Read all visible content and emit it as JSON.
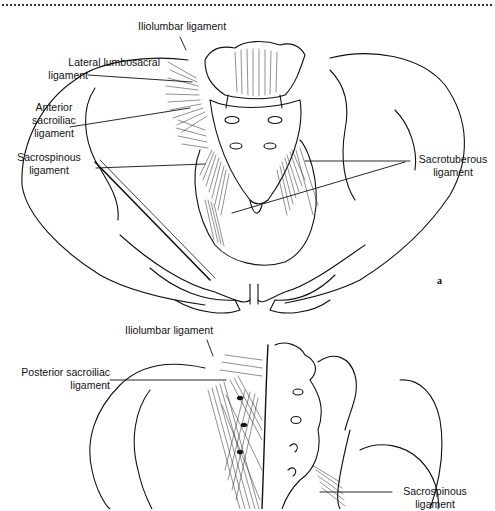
{
  "figure": {
    "type": "anatomical-illustration",
    "header_rule": "dotted",
    "panels": [
      {
        "id": "a",
        "view": "anterior",
        "letter": "a",
        "labels": [
          {
            "key": "iliolumbar",
            "lines": [
              "Iliolumbar ligament"
            ]
          },
          {
            "key": "lateral_lumbosacral",
            "lines": [
              "Lateral lumbosacral",
              "ligament"
            ]
          },
          {
            "key": "anterior_sacroiliac",
            "lines": [
              "Anterior",
              "sacroiliac",
              "ligament"
            ]
          },
          {
            "key": "sacrospinous",
            "lines": [
              "Sacrospinous",
              "ligament"
            ]
          },
          {
            "key": "sacrotuberous",
            "lines": [
              "Sacrotuberous",
              "ligament"
            ]
          }
        ]
      },
      {
        "id": "b",
        "view": "posterior",
        "labels": [
          {
            "key": "iliolumbar",
            "lines": [
              "Iliolumbar ligament"
            ]
          },
          {
            "key": "posterior_sacroiliac",
            "lines": [
              "Posterior sacroiliac",
              "ligament"
            ]
          },
          {
            "key": "sacrospinous",
            "lines": [
              "Sacrospinous",
              "ligament"
            ]
          }
        ]
      }
    ]
  },
  "a": {
    "letter": "a",
    "iliolumbar": "Iliolumbar ligament",
    "lateral_lumbosacral_1": "Lateral lumbosacral",
    "lateral_lumbosacral_2": "ligament",
    "anterior_sacroiliac_1": "Anterior",
    "anterior_sacroiliac_2": "sacroiliac",
    "anterior_sacroiliac_3": "ligament",
    "sacrospinous_1": "Sacrospinous",
    "sacrospinous_2": "ligament",
    "sacrotuberous_1": "Sacrotuberous",
    "sacrotuberous_2": "ligament"
  },
  "b": {
    "iliolumbar": "Iliolumbar ligament",
    "posterior_sacroiliac_1": "Posterior sacroiliac",
    "posterior_sacroiliac_2": "ligament",
    "sacrospinous_1": "Sacrospinous",
    "sacrospinous_2": "ligament"
  },
  "colors": {
    "ink": "#111111",
    "background": "#ffffff"
  }
}
